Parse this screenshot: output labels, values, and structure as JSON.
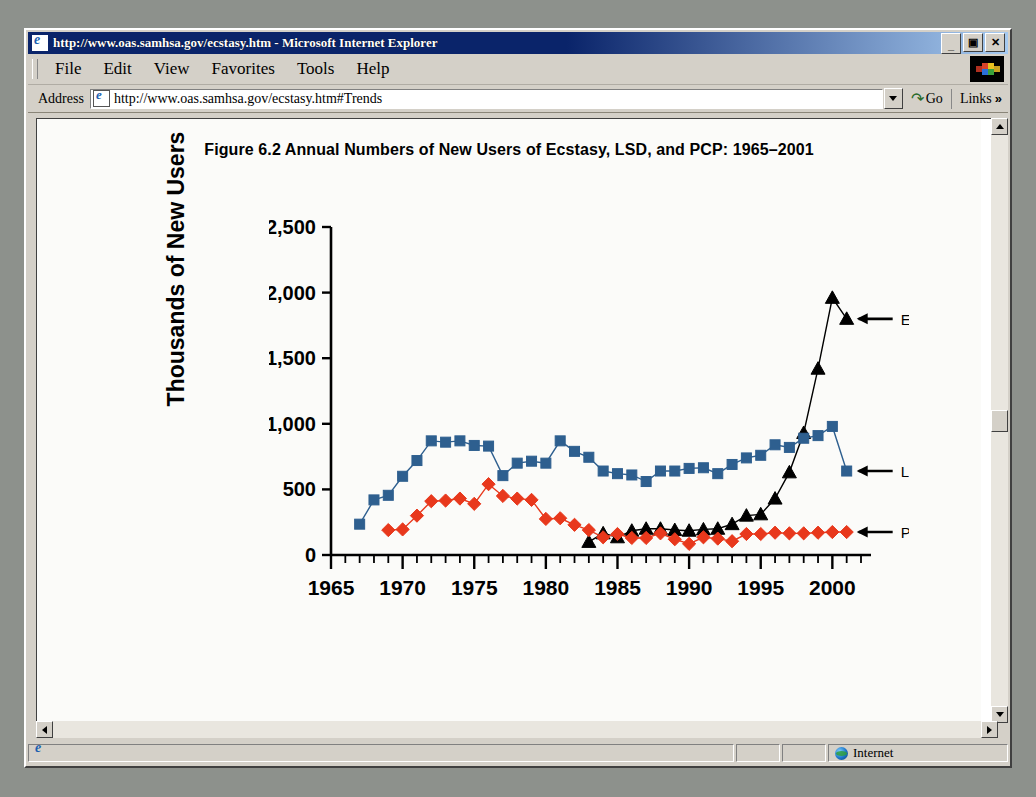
{
  "window": {
    "title": "http://www.oas.samhsa.gov/ecstasy.htm - Microsoft Internet Explorer",
    "minimize_label": "_",
    "restore_label": "▣",
    "close_label": "✕"
  },
  "menu": {
    "items": [
      {
        "label": "File"
      },
      {
        "label": "Edit"
      },
      {
        "label": "View"
      },
      {
        "label": "Favorites"
      },
      {
        "label": "Tools"
      },
      {
        "label": "Help"
      }
    ]
  },
  "address_bar": {
    "label": "Address",
    "value": "http://www.oas.samhsa.gov/ecstasy.htm#Trends",
    "go_label": "Go",
    "links_label": "Links",
    "overflow_label": "»"
  },
  "status_bar": {
    "message": "",
    "zone": "Internet"
  },
  "page": {
    "d_link": "D"
  },
  "chart_data": {
    "type": "line",
    "title": "Figure 6.2  Annual Numbers of New Users of Ecstasy, LSD, and PCP: 1965–2001",
    "xlabel": "",
    "ylabel": "Thousands of New Users",
    "xlim": [
      1965,
      2002
    ],
    "ylim": [
      0,
      2500
    ],
    "ytick_labels": [
      "0",
      "500",
      "1,000",
      "1,500",
      "2,000",
      "2,500"
    ],
    "ytick_values": [
      0,
      500,
      1000,
      1500,
      2000,
      2500
    ],
    "xtick_labels": [
      "1965",
      "1970",
      "1975",
      "1980",
      "1985",
      "1990",
      "1995",
      "2000"
    ],
    "xtick_values": [
      1965,
      1970,
      1975,
      1980,
      1985,
      1990,
      1995,
      2000
    ],
    "minor_xticks_every": 1,
    "grid": false,
    "legend_position": "right-inline-arrows",
    "series": [
      {
        "name": "Ecstasy",
        "color": "#000000",
        "marker": "triangle",
        "x": [
          1983,
          1984,
          1985,
          1986,
          1987,
          1988,
          1989,
          1990,
          1991,
          1992,
          1993,
          1994,
          1995,
          1996,
          1997,
          1998,
          1999,
          2000,
          2001
        ],
        "values": [
          100,
          165,
          135,
          185,
          200,
          200,
          190,
          185,
          195,
          200,
          235,
          300,
          310,
          430,
          630,
          930,
          1420,
          1960,
          1800
        ]
      },
      {
        "name": "LSD",
        "color": "#2e5f8f",
        "marker": "square",
        "x": [
          1967,
          1968,
          1969,
          1970,
          1971,
          1972,
          1973,
          1974,
          1975,
          1976,
          1977,
          1978,
          1979,
          1980,
          1981,
          1982,
          1983,
          1984,
          1985,
          1986,
          1987,
          1988,
          1989,
          1990,
          1991,
          1992,
          1993,
          1994,
          1995,
          1996,
          1997,
          1998,
          1999,
          2000,
          2001
        ],
        "values": [
          235,
          420,
          455,
          600,
          720,
          870,
          860,
          870,
          835,
          830,
          605,
          700,
          715,
          700,
          870,
          790,
          745,
          640,
          620,
          610,
          560,
          640,
          640,
          660,
          665,
          620,
          690,
          740,
          760,
          840,
          820,
          890,
          910,
          980,
          640
        ]
      },
      {
        "name": "PCP",
        "color": "#e8381c",
        "marker": "diamond",
        "x": [
          1969,
          1970,
          1971,
          1972,
          1973,
          1974,
          1975,
          1976,
          1977,
          1978,
          1979,
          1980,
          1981,
          1982,
          1983,
          1984,
          1985,
          1986,
          1987,
          1988,
          1989,
          1990,
          1991,
          1992,
          1993,
          1994,
          1995,
          1996,
          1997,
          1998,
          1999,
          2000,
          2001
        ],
        "values": [
          190,
          195,
          300,
          410,
          415,
          430,
          390,
          540,
          450,
          430,
          420,
          275,
          280,
          230,
          190,
          135,
          160,
          130,
          130,
          165,
          120,
          85,
          135,
          125,
          105,
          160,
          160,
          170,
          165,
          165,
          170,
          175,
          175
        ]
      }
    ]
  }
}
